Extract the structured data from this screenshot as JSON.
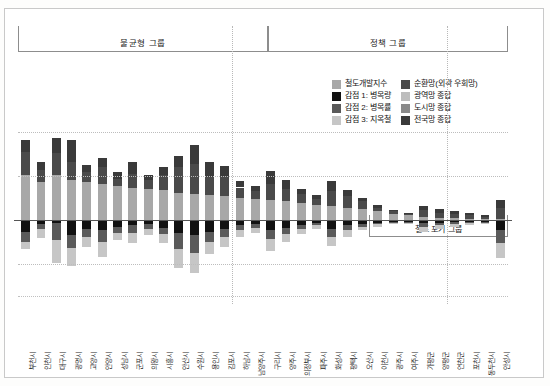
{
  "groups": {
    "header_left": "불균형 그룹",
    "header_right": "정책 그룹",
    "header_sub": "철도 포기 그룹"
  },
  "legend": {
    "items": [
      {
        "label": "철도개발지수",
        "color": "#a8a8a8",
        "col": 0
      },
      {
        "label": "감점 1: 병목량",
        "color": "#111111",
        "col": 0
      },
      {
        "label": "감점 2: 병목률",
        "color": "#5a5a5a",
        "col": 0
      },
      {
        "label": "감점 3: 지옥철",
        "color": "#c6c6c6",
        "col": 0
      },
      {
        "label": "순환망(외곽 우회망)",
        "color": "#4a4a4a",
        "col": 1
      },
      {
        "label": "광역망 종합",
        "color": "#bdbdbd",
        "col": 1
      },
      {
        "label": "도시망 종합",
        "color": "#8a8a8a",
        "col": 1
      },
      {
        "label": "전국망 종합",
        "color": "#3a3a3a",
        "col": 1
      }
    ]
  },
  "chart_data": {
    "type": "bar",
    "title": "",
    "subtitle": "",
    "xlabel": "",
    "ylabel": "",
    "ylim": [
      -60,
      70
    ],
    "grid": true,
    "stacked": true,
    "legend_position": "top-right",
    "gridlines": [
      70,
      35,
      0,
      -35
    ],
    "group_boundaries": [
      14,
      28
    ],
    "categories": [
      "부천시",
      "인천시",
      "대구시",
      "광명시",
      "고양시",
      "안양시",
      "성남시",
      "군포시",
      "의왕시",
      "시흥시",
      "안산시",
      "수원시",
      "용인시",
      "김포시",
      "하남시",
      "남양주시",
      "구리시",
      "양주시",
      "의정부시",
      "파주시",
      "화성시",
      "평택시",
      "오산시",
      "이천시",
      "광주시",
      "여주시",
      "가평군",
      "양평군",
      "연천군",
      "포천시",
      "동두천시",
      "안성시"
    ],
    "series": [
      {
        "name": "철도개발지수",
        "color": "#a8a8a8",
        "values": [
          36,
          30,
          36,
          32,
          30,
          29,
          27,
          26,
          25,
          24,
          22,
          21,
          20,
          19,
          18,
          17,
          16,
          15,
          14,
          12,
          11,
          10,
          9,
          7,
          5,
          4,
          3,
          2,
          2,
          1,
          1,
          1
        ]
      },
      {
        "name": "순환망(외곽 우회망)",
        "color": "#4a4a4a",
        "values": [
          18,
          10,
          17,
          14,
          8,
          13,
          6,
          11,
          7,
          12,
          20,
          24,
          14,
          16,
          8,
          6,
          13,
          10,
          7,
          5,
          12,
          9,
          6,
          3,
          2,
          1,
          5,
          4,
          3,
          3,
          2,
          9
        ]
      },
      {
        "name": "전국망 종합",
        "color": "#3a3a3a",
        "values": [
          10,
          6,
          12,
          18,
          6,
          7,
          5,
          9,
          4,
          6,
          9,
          15,
          12,
          8,
          5,
          4,
          10,
          7,
          4,
          3,
          8,
          5,
          3,
          2,
          1,
          1,
          3,
          3,
          2,
          2,
          1,
          6
        ]
      },
      {
        "name": "감점 1: 병목량",
        "color": "#111111",
        "values": [
          -9,
          -3,
          -2,
          -12,
          -7,
          -8,
          -5,
          -4,
          -3,
          -6,
          -10,
          -12,
          -9,
          -7,
          -4,
          -3,
          -8,
          -6,
          -4,
          -2,
          -7,
          -4,
          -3,
          -2,
          -1,
          -1,
          -2,
          -2,
          -1,
          -1,
          -1,
          -8
        ]
      },
      {
        "name": "감점 2: 병목률",
        "color": "#5a5a5a",
        "values": [
          -8,
          -4,
          -14,
          -10,
          -6,
          -9,
          -5,
          -6,
          -4,
          -5,
          -13,
          -14,
          -8,
          -6,
          -4,
          -3,
          -7,
          -5,
          -3,
          -2,
          -6,
          -4,
          -2,
          -1,
          -1,
          -1,
          -3,
          -2,
          -2,
          -1,
          -1,
          -10
        ]
      },
      {
        "name": "감점 3: 지옥철",
        "color": "#c6c6c6",
        "values": [
          -6,
          -7,
          -18,
          -14,
          -8,
          -12,
          -6,
          -8,
          -5,
          -7,
          -15,
          -16,
          -10,
          -8,
          -5,
          -4,
          -9,
          -6,
          -4,
          -3,
          -7,
          -5,
          -3,
          -2,
          -1,
          -1,
          -4,
          -3,
          -2,
          -2,
          -1,
          -12
        ]
      }
    ]
  },
  "xaxis": {
    "labels": [
      "부천시",
      "인천시",
      "대구시",
      "광명시",
      "고양시",
      "안양시",
      "성남시",
      "군포시",
      "의왕시",
      "시흥시",
      "안산시",
      "수원시",
      "용인시",
      "김포시",
      "하남시",
      "남양주시",
      "구리시",
      "양주시",
      "의정부시",
      "파주시",
      "화성시",
      "평택시",
      "오산시",
      "이천시",
      "광주시",
      "여주시",
      "가평군",
      "양평군",
      "연천군",
      "포천시",
      "동두천시",
      "안성시"
    ]
  }
}
